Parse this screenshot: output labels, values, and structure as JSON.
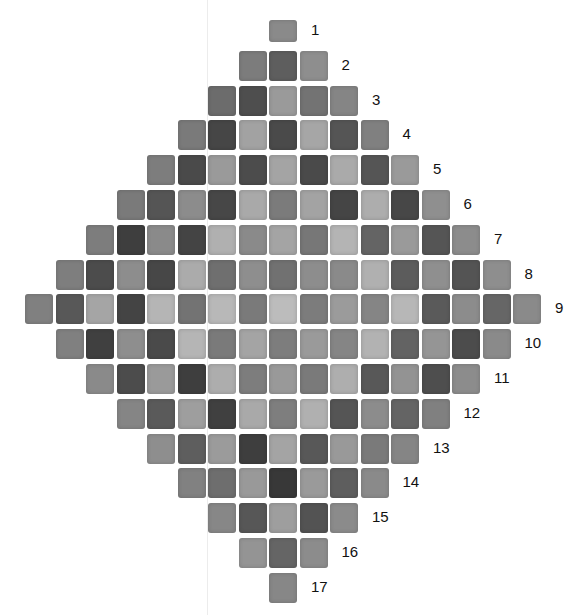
{
  "figure": {
    "row_labels": [
      "1",
      "2",
      "3",
      "4",
      "5",
      "6",
      "7",
      "8",
      "9",
      "10",
      "11",
      "12",
      "13",
      "14",
      "15",
      "16",
      "17"
    ],
    "rows": [
      [
        "#8a8a8a"
      ],
      [
        "#7c7c7c",
        "#5e5e5e",
        "#8e8e8e"
      ],
      [
        "#6c6c6c",
        "#4e4e4e",
        "#9a9a9a",
        "#737373",
        "#858585"
      ],
      [
        "#7a7a7a",
        "#464646",
        "#a2a2a2",
        "#4a4a4a",
        "#a6a6a6",
        "#555555",
        "#808080"
      ],
      [
        "#7d7d7d",
        "#4a4a4a",
        "#9a9a9a",
        "#4c4c4c",
        "#a4a4a4",
        "#4a4a4a",
        "#aaaaaa",
        "#555555",
        "#9a9a9a"
      ],
      [
        "#7a7a7a",
        "#555555",
        "#8c8c8c",
        "#474747",
        "#a9a9a9",
        "#7b7b7b",
        "#a3a3a3",
        "#454545",
        "#adadad",
        "#474747",
        "#8f8f8f"
      ],
      [
        "#7d7d7d",
        "#3e3e3e",
        "#8a8a8a",
        "#444444",
        "#b0b0b0",
        "#8a8a8a",
        "#a4a4a4",
        "#777777",
        "#b4b4b4",
        "#646464",
        "#9a9a9a",
        "#555555",
        "#8c8c8c"
      ],
      [
        "#7e7e7e",
        "#4c4c4c",
        "#8d8d8d",
        "#474747",
        "#ababab",
        "#6f6f6f",
        "#8e8e8e",
        "#717171",
        "#8d8d8d",
        "#8a8a8a",
        "#b0b0b0",
        "#5c5c5c",
        "#8f8f8f",
        "#545454",
        "#8e8e8e"
      ],
      [
        "#808080",
        "#585858",
        "#a5a5a5",
        "#444444",
        "#b5b5b5",
        "#737373",
        "#b8b8b8",
        "#7a7a7a",
        "#bcbcbc",
        "#7c7c7c",
        "#9b9b9b",
        "#858585",
        "#b7b7b7",
        "#5a5a5a",
        "#8c8c8c",
        "#666666",
        "#8a8a8a"
      ],
      [
        "#808080",
        "#404040",
        "#8e8e8e",
        "#4a4a4a",
        "#b5b5b5",
        "#7a7a7a",
        "#a4a4a4",
        "#7d7d7d",
        "#9a9a9a",
        "#858585",
        "#b2b2b2",
        "#636363",
        "#959595",
        "#4c4c4c",
        "#8a8a8a"
      ],
      [
        "#8a8a8a",
        "#4c4c4c",
        "#9a9a9a",
        "#3e3e3e",
        "#adadad",
        "#7d7d7d",
        "#999999",
        "#7a7a7a",
        "#aeaeae",
        "#585858",
        "#939393",
        "#4e4e4e",
        "#8c8c8c"
      ],
      [
        "#858585",
        "#5a5a5a",
        "#9e9e9e",
        "#404040",
        "#a9a9a9",
        "#7e7e7e",
        "#b0b0b0",
        "#555555",
        "#8c8c8c",
        "#646464",
        "#808080"
      ],
      [
        "#8e8e8e",
        "#5e5e5e",
        "#9b9b9b",
        "#3e3e3e",
        "#a4a4a4",
        "#585858",
        "#999999",
        "#7a7a7a",
        "#858585"
      ],
      [
        "#818181",
        "#6e6e6e",
        "#999999",
        "#383838",
        "#9a9a9a",
        "#5e5e5e",
        "#8a8a8a"
      ],
      [
        "#878787",
        "#575757",
        "#9e9e9e",
        "#535353",
        "#8b8b8b"
      ],
      [
        "#949494",
        "#656565",
        "#8c8c8c"
      ],
      [
        "#878787"
      ]
    ]
  }
}
